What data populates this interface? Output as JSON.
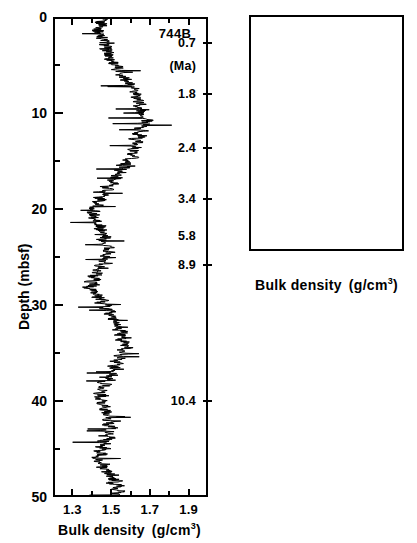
{
  "figure": {
    "site_label": "744B",
    "age_unit_label": "(Ma)",
    "y_axis_title": "Depth  (mbsf)",
    "x_axis_title": "Bulk density",
    "x_axis_unit_main": "(g/cm",
    "x_axis_unit_sup": "3",
    "x_axis_unit_tail": ")"
  },
  "chart_data": {
    "type": "line",
    "xlabel": "Bulk density (g/cm3)",
    "ylabel": "Depth (mbsf)",
    "grid": false,
    "legend": null,
    "orientation": "depth-on-y-inverted",
    "panels": [
      {
        "name": "upper-panel",
        "site": "744B",
        "xlim": [
          1.2,
          2.0
        ],
        "ylim": [
          0,
          50
        ],
        "x_major_ticks": [
          1.3,
          1.5,
          1.7,
          1.9
        ],
        "x_major_tick_labels": [
          "1.3",
          "1.5",
          "1.7",
          "1.9"
        ],
        "x_minor_ticks": [
          1.2,
          1.4,
          1.6,
          1.8,
          2.0
        ],
        "y_major_ticks": [
          0,
          10,
          20,
          30,
          40,
          50
        ],
        "y_major_tick_labels": [
          "0",
          "10",
          "20",
          "30",
          "40",
          "50"
        ],
        "y_minor_ticks": [
          5,
          15,
          25,
          35,
          45
        ],
        "age_labels": [
          {
            "text": "0.7",
            "depth": 2.7,
            "tick": true
          },
          {
            "text": "(Ma)",
            "depth": 5.1,
            "tick": false
          },
          {
            "text": "1.8",
            "depth": 8.0,
            "tick": true
          },
          {
            "text": "2.4",
            "depth": 13.6,
            "tick": true
          },
          {
            "text": "3.4",
            "depth": 19.0,
            "tick": true
          },
          {
            "text": "5.8",
            "depth": 22.8,
            "tick": false
          },
          {
            "text": "8.9",
            "depth": 25.8,
            "tick": true
          },
          {
            "text": "10.4",
            "depth": 40.0,
            "tick": true
          }
        ],
        "series_name": "bulk density",
        "x": [
          1.46,
          1.45,
          1.44,
          1.46,
          1.45,
          1.43,
          1.44,
          1.46,
          1.45,
          1.47,
          1.46,
          1.48,
          1.47,
          1.49,
          1.48,
          1.5,
          1.49,
          1.52,
          1.51,
          1.54,
          1.53,
          1.56,
          1.55,
          1.58,
          1.57,
          1.6,
          1.59,
          1.62,
          1.61,
          1.63,
          1.62,
          1.65,
          1.64,
          1.66,
          1.63,
          1.67,
          1.64,
          1.68,
          1.65,
          1.69,
          1.66,
          1.68,
          1.64,
          1.67,
          1.63,
          1.66,
          1.62,
          1.65,
          1.61,
          1.64,
          1.6,
          1.63,
          1.58,
          1.62,
          1.57,
          1.6,
          1.55,
          1.58,
          1.53,
          1.56,
          1.51,
          1.54,
          1.49,
          1.52,
          1.47,
          1.5,
          1.45,
          1.48,
          1.43,
          1.46,
          1.41,
          1.44,
          1.4,
          1.43,
          1.39,
          1.42,
          1.4,
          1.43,
          1.41,
          1.45,
          1.43,
          1.47,
          1.44,
          1.48,
          1.45,
          1.49,
          1.46,
          1.5,
          1.47,
          1.51,
          1.46,
          1.5,
          1.44,
          1.48,
          1.43,
          1.46,
          1.41,
          1.45,
          1.4,
          1.43,
          1.39,
          1.42,
          1.38,
          1.41,
          1.4,
          1.44,
          1.42,
          1.46,
          1.44,
          1.48,
          1.46,
          1.5,
          1.48,
          1.52,
          1.5,
          1.54,
          1.52,
          1.56,
          1.53,
          1.57,
          1.54,
          1.58,
          1.55,
          1.59,
          1.56,
          1.59,
          1.55,
          1.58,
          1.53,
          1.57,
          1.52,
          1.55,
          1.5,
          1.54,
          1.48,
          1.52,
          1.47,
          1.5,
          1.45,
          1.49,
          1.44,
          1.47,
          1.43,
          1.46,
          1.42,
          1.46,
          1.44,
          1.48,
          1.45,
          1.49,
          1.46,
          1.5,
          1.47,
          1.51,
          1.48,
          1.52,
          1.47,
          1.51,
          1.46,
          1.5,
          1.45,
          1.48,
          1.43,
          1.47,
          1.42,
          1.46,
          1.41,
          1.45,
          1.43,
          1.47,
          1.45,
          1.49,
          1.47,
          1.51,
          1.49,
          1.53,
          1.5,
          1.54,
          1.51,
          1.55,
          1.52,
          1.56,
          1.5,
          1.54
        ],
        "y": [
          0.0,
          0.28,
          0.55,
          0.83,
          1.1,
          1.38,
          1.66,
          1.93,
          2.21,
          2.48,
          2.76,
          3.03,
          3.31,
          3.59,
          3.86,
          4.14,
          4.41,
          4.69,
          4.97,
          5.24,
          5.52,
          5.79,
          6.07,
          6.34,
          6.62,
          6.9,
          7.17,
          7.45,
          7.72,
          8.0,
          8.28,
          8.55,
          8.83,
          9.1,
          9.38,
          9.66,
          9.93,
          10.2,
          10.48,
          10.76,
          11.03,
          11.31,
          11.59,
          11.86,
          12.14,
          12.41,
          12.69,
          12.97,
          13.24,
          13.52,
          13.79,
          14.07,
          14.34,
          14.62,
          14.9,
          15.17,
          15.45,
          15.72,
          16.0,
          16.28,
          16.55,
          16.83,
          17.1,
          17.38,
          17.66,
          17.93,
          18.21,
          18.48,
          18.76,
          19.03,
          19.31,
          19.59,
          19.86,
          20.14,
          20.41,
          20.69,
          20.97,
          21.24,
          21.52,
          21.79,
          22.07,
          22.34,
          22.62,
          22.9,
          23.17,
          23.45,
          23.72,
          24.0,
          24.28,
          24.55,
          24.83,
          25.1,
          25.38,
          25.66,
          25.93,
          26.21,
          26.48,
          26.76,
          27.03,
          27.31,
          27.59,
          27.86,
          28.14,
          28.41,
          28.69,
          28.97,
          29.24,
          29.52,
          29.79,
          30.07,
          30.34,
          30.62,
          30.9,
          31.17,
          31.45,
          31.72,
          32.0,
          32.28,
          32.55,
          32.83,
          33.1,
          33.38,
          33.66,
          33.93,
          34.21,
          34.48,
          34.76,
          35.03,
          35.31,
          35.59,
          35.86,
          36.14,
          36.41,
          36.69,
          36.97,
          37.24,
          37.52,
          37.79,
          38.07,
          38.34,
          38.62,
          38.9,
          39.17,
          39.45,
          39.72,
          40.0,
          40.28,
          40.55,
          40.83,
          41.1,
          41.38,
          41.66,
          41.93,
          42.21,
          42.48,
          42.76,
          43.03,
          43.31,
          43.59,
          43.86,
          44.14,
          44.41,
          44.69,
          44.97,
          45.24,
          45.52,
          45.79,
          46.07,
          46.34,
          46.62,
          46.9,
          47.17,
          47.45,
          47.72,
          48.0,
          48.28,
          48.55,
          48.83,
          49.1,
          49.38,
          49.66,
          49.93,
          50.0
        ]
      },
      {
        "name": "lower-panel",
        "xlim": [
          1.2,
          2.0
        ],
        "ylim": [
          50,
          76.5
        ],
        "x_major_ticks": [
          1.3,
          1.5,
          1.7,
          1.9
        ],
        "x_major_tick_labels": [
          "1.3",
          "1.5",
          "1.7",
          "1.9"
        ],
        "x_minor_ticks": [
          1.2,
          1.4,
          1.6,
          1.8,
          2.0
        ],
        "y_major_ticks": [
          50,
          60,
          70
        ],
        "y_major_tick_labels": [
          "50",
          "60",
          "70"
        ],
        "y_minor_ticks": [
          55,
          65,
          75
        ],
        "age_labels": [
          {
            "text": "11.0",
            "depth": 51.0,
            "tick": false
          },
          {
            "text": "13.6",
            "depth": 54.5,
            "tick": true
          },
          {
            "text": "14.8",
            "depth": 59.5,
            "tick": true
          },
          {
            "text": "15.2",
            "depth": 61.0,
            "tick": false
          },
          {
            "text": "16.9",
            "depth": 66.5,
            "tick": true
          },
          {
            "text": "17.5",
            "depth": 71.5,
            "tick": true
          }
        ],
        "series_name": "bulk density",
        "x": [
          1.74,
          1.76,
          1.75,
          1.77,
          1.73,
          1.75,
          1.72,
          1.74,
          1.7,
          1.73,
          1.69,
          1.72,
          1.68,
          1.71,
          1.67,
          1.7,
          1.66,
          1.69,
          1.65,
          1.68,
          1.64,
          1.67,
          1.63,
          1.66,
          1.65,
          1.68,
          1.67,
          1.7,
          1.69,
          1.72,
          1.7,
          1.73,
          1.71,
          1.74,
          1.72,
          1.75,
          1.73,
          1.76,
          1.75,
          1.78,
          1.76,
          1.79,
          1.77,
          1.8,
          1.78,
          1.81,
          1.76,
          1.79,
          1.74,
          1.77,
          1.72,
          1.75,
          1.7,
          1.73,
          1.68,
          1.71,
          1.66,
          1.7,
          1.68,
          1.72,
          1.7,
          1.74,
          1.72,
          1.76,
          1.74,
          1.78,
          1.75,
          1.79,
          1.76,
          1.8,
          1.77,
          1.8,
          1.75,
          1.78,
          1.73,
          1.76,
          1.71,
          1.74,
          1.69,
          1.72,
          1.67,
          1.7,
          1.65,
          1.68,
          1.63,
          1.66,
          1.61,
          1.64,
          1.63,
          1.67,
          1.65,
          1.69,
          1.67,
          1.7,
          1.68,
          1.71,
          1.69,
          1.72,
          1.7,
          1.73,
          1.71,
          1.74,
          1.7,
          1.73,
          1.69,
          1.72,
          1.68,
          1.71,
          1.69,
          1.72,
          1.7,
          1.73,
          1.71,
          1.74,
          1.72,
          1.75,
          1.73,
          1.77,
          1.75,
          1.79,
          1.76,
          1.8,
          1.78,
          1.82,
          1.79,
          1.83,
          1.8,
          1.83,
          1.78,
          1.81
        ]
      }
    ]
  }
}
